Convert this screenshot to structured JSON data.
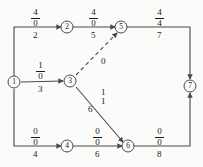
{
  "diagram": {
    "stroke_color": "#4a4a4a",
    "text_color": "#1a1a1a",
    "background": "#fbfbfa",
    "nodes": [
      {
        "id": "1",
        "label": "1",
        "x": 14,
        "y": 82
      },
      {
        "id": "2",
        "label": "2",
        "x": 67,
        "y": 27
      },
      {
        "id": "3",
        "label": "3",
        "x": 70,
        "y": 80
      },
      {
        "id": "4",
        "label": "4",
        "x": 67,
        "y": 146
      },
      {
        "id": "5",
        "label": "5",
        "x": 121,
        "y": 27
      },
      {
        "id": "6",
        "label": "6",
        "x": 128,
        "y": 146
      },
      {
        "id": "7",
        "label": "7",
        "x": 190,
        "y": 86
      }
    ],
    "edges": [
      {
        "id": "e1-2",
        "from": "1",
        "to": "2",
        "style": "solid",
        "flow": "4",
        "capacity": "0",
        "cost": "2"
      },
      {
        "id": "e2-5",
        "from": "2",
        "to": "5",
        "style": "solid",
        "flow": "4",
        "capacity": "0",
        "cost": "5"
      },
      {
        "id": "e5-7",
        "from": "5",
        "to": "7",
        "style": "solid",
        "flow": "4",
        "capacity": "4",
        "cost": "7"
      },
      {
        "id": "e1-3",
        "from": "1",
        "to": "3",
        "style": "solid",
        "flow": "1",
        "capacity": "0",
        "cost": "3"
      },
      {
        "id": "e3-5",
        "from": "3",
        "to": "5",
        "style": "dashed",
        "flow": "",
        "capacity": "",
        "cost": "0"
      },
      {
        "id": "e3-6",
        "from": "3",
        "to": "6",
        "style": "solid",
        "flow": "1",
        "capacity": "1",
        "cost": "6"
      },
      {
        "id": "e1-4",
        "from": "1",
        "to": "4",
        "style": "solid",
        "flow": "0",
        "capacity": "0",
        "cost": "4"
      },
      {
        "id": "e4-6",
        "from": "4",
        "to": "6",
        "style": "solid",
        "flow": "0",
        "capacity": "0",
        "cost": "6"
      },
      {
        "id": "e6-7",
        "from": "6",
        "to": "7",
        "style": "solid",
        "flow": "0",
        "capacity": "0",
        "cost": "8"
      }
    ],
    "labels": {
      "e1_2_num": "4",
      "e1_2_den": "0",
      "e1_2_cost": "2",
      "e2_5_num": "4",
      "e2_5_den": "0",
      "e2_5_cost": "5",
      "e5_7_num": "4",
      "e5_7_den": "4",
      "e5_7_cost": "7",
      "e1_3_num": "1",
      "e1_3_den": "0",
      "e1_3_cost": "3",
      "e3_5_cost": "0",
      "e3_6_num": "1",
      "e3_6_den": "1",
      "e3_6_cost": "6",
      "e1_4_num": "0",
      "e1_4_den": "0",
      "e1_4_cost": "4",
      "e4_6_num": "0",
      "e4_6_den": "0",
      "e4_6_cost": "6",
      "e6_7_num": "0",
      "e6_7_den": "0",
      "e6_7_cost": "8"
    },
    "node_labels": {
      "n1": "1",
      "n2": "2",
      "n3": "3",
      "n4": "4",
      "n5": "5",
      "n6": "6",
      "n7": "7"
    }
  }
}
